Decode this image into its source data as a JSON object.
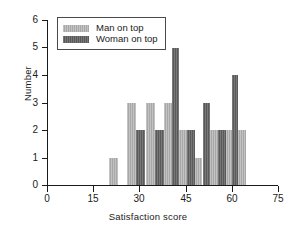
{
  "chart_data": {
    "type": "bar",
    "title": "",
    "xlabel": "Satisfaction score",
    "ylabel": "Number",
    "xlim": [
      0,
      75
    ],
    "ylim": [
      0,
      6
    ],
    "xticks": [
      0,
      15,
      30,
      45,
      60,
      75
    ],
    "yticks": [
      0,
      1,
      2,
      3,
      4,
      5,
      6
    ],
    "grid": false,
    "legend_position": "top-left",
    "bin_width": 3,
    "series": [
      {
        "name": "Man on top",
        "color": "#a8a8a8",
        "bins": [
          21,
          27,
          33,
          39,
          45,
          51,
          57,
          60
        ],
        "values": [
          1,
          3,
          3,
          3,
          2,
          2,
          2,
          2
        ]
      },
      {
        "name": "Woman on top",
        "color": "#5a5a5a",
        "bins": [
          30,
          36,
          39,
          42,
          48,
          54,
          57
        ],
        "values": [
          2,
          2,
          5,
          2,
          3,
          2,
          4
        ]
      }
    ],
    "bars": [
      {
        "score": 21,
        "group": "Man on top",
        "value": 1,
        "x0": 20.0,
        "x1": 23.0
      },
      {
        "score": 27,
        "group": "Man on top",
        "value": 3,
        "x0": 26.0,
        "x1": 29.0
      },
      {
        "score": 30,
        "group": "Woman on top",
        "value": 2,
        "x0": 29.0,
        "x1": 32.0
      },
      {
        "score": 33,
        "group": "Man on top",
        "value": 3,
        "x0": 32.0,
        "x1": 35.0
      },
      {
        "score": 36,
        "group": "Woman on top",
        "value": 2,
        "x0": 35.0,
        "x1": 38.0
      },
      {
        "score": 39,
        "group": "Man on top",
        "value": 3,
        "x0": 38.0,
        "x1": 40.5
      },
      {
        "score": 40,
        "group": "Woman on top",
        "value": 5,
        "x0": 40.5,
        "x1": 43.0
      },
      {
        "score": 43,
        "group": "Man on top",
        "value": 2,
        "x0": 43.0,
        "x1": 45.5
      },
      {
        "score": 45,
        "group": "Woman on top",
        "value": 2,
        "x0": 45.5,
        "x1": 48.0
      },
      {
        "score": 48,
        "group": "Man on top",
        "value": 1,
        "x0": 48.0,
        "x1": 50.5
      },
      {
        "score": 50,
        "group": "Woman on top",
        "value": 3,
        "x0": 50.5,
        "x1": 53.0
      },
      {
        "score": 53,
        "group": "Man on top",
        "value": 2,
        "x0": 53.0,
        "x1": 55.5
      },
      {
        "score": 55,
        "group": "Woman on top",
        "value": 2,
        "x0": 55.5,
        "x1": 58.0
      },
      {
        "score": 58,
        "group": "Man on top",
        "value": 2,
        "x0": 58.0,
        "x1": 60.0
      },
      {
        "score": 60,
        "group": "Woman on top",
        "value": 4,
        "x0": 60.0,
        "x1": 62.0
      },
      {
        "score": 62,
        "group": "Man on top",
        "value": 2,
        "x0": 62.0,
        "x1": 64.5
      }
    ]
  },
  "legend": {
    "items": [
      {
        "label": "Man on top",
        "key": "light"
      },
      {
        "label": "Woman on top",
        "key": "dark"
      }
    ]
  }
}
